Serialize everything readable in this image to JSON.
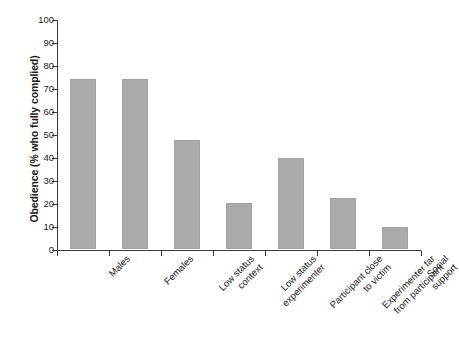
{
  "chart_data": {
    "type": "bar",
    "title": "",
    "subtitle": "",
    "xlabel": "",
    "ylabel": "Obedience (% who fully complied)",
    "categories": [
      "Males",
      "Females",
      "Low status\ncontext",
      "Low status\nexperimenter",
      "Participant close\nto victim",
      "Experimenter far\nfrom participant",
      "Social support"
    ],
    "values": [
      74,
      74,
      47.5,
      20,
      39.5,
      22,
      9.5
    ],
    "ylim": [
      0,
      100
    ],
    "ytick_values": [
      0,
      10,
      20,
      30,
      40,
      50,
      60,
      70,
      80,
      90,
      100
    ],
    "ytick_labels": [
      "0",
      "10",
      "20",
      "30",
      "40",
      "50",
      "60",
      "70",
      "80",
      "90",
      "100"
    ],
    "grid": false,
    "legend": false,
    "legend_position": "none",
    "bar_color": "#ababab",
    "axis_color": "#3a3a3a",
    "background_color": "#ffffff",
    "xtick_style": "category-boundaries",
    "xlabel_rotation_deg": 45
  }
}
